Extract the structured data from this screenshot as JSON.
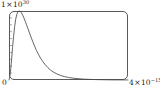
{
  "chart_data": {
    "type": "line",
    "title": "",
    "xlabel": "",
    "ylabel": "",
    "grid": false,
    "legend": null,
    "frame": "rounded-rectangle",
    "xlim": [
      0,
      4e-15
    ],
    "ylim": [
      0,
      1e+30
    ],
    "y_tick_count": 9,
    "axis_labels": {
      "y_max_mantissa": "1",
      "y_max_times": "×",
      "y_max_base": "10",
      "y_max_exponent": "30",
      "y_min": "0",
      "x_max_mantissa": "4",
      "x_max_times": "×",
      "x_max_base": "10",
      "x_max_exponent": "−15"
    },
    "series": [
      {
        "name": "distribution",
        "color": "#4a4a4a",
        "x": [
          0.0,
          0.03,
          0.06,
          0.09,
          0.12,
          0.155,
          0.19,
          0.225,
          0.26,
          0.3,
          0.34,
          0.38,
          0.42,
          0.46,
          0.5,
          0.545,
          0.59,
          0.64,
          0.69,
          0.74,
          0.8,
          0.86,
          0.92,
          0.99,
          1.06,
          1.14,
          1.22,
          1.31,
          1.4,
          1.5,
          1.61,
          1.73,
          1.86,
          2.0,
          2.15,
          2.32,
          2.5,
          2.7,
          2.92,
          3.16,
          3.42,
          3.7,
          4.0
        ],
        "y": [
          0.0,
          0.055,
          0.165,
          0.315,
          0.475,
          0.635,
          0.775,
          0.88,
          0.948,
          0.988,
          1.0,
          0.993,
          0.972,
          0.94,
          0.9,
          0.852,
          0.8,
          0.742,
          0.682,
          0.622,
          0.555,
          0.492,
          0.432,
          0.372,
          0.317,
          0.265,
          0.22,
          0.178,
          0.143,
          0.113,
          0.088,
          0.067,
          0.05,
          0.037,
          0.027,
          0.019,
          0.013,
          0.009,
          0.006,
          0.004,
          0.002,
          0.0013,
          0.0008
        ],
        "x_units": "1e-15",
        "y_units": "1e30",
        "peak_x": 0.34,
        "peak_y": 1.0
      }
    ]
  }
}
